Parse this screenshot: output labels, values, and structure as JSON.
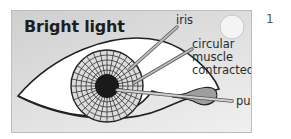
{
  "diagram": {
    "title": "Bright light",
    "labels": {
      "iris": "iris",
      "muscle_line1": "circular",
      "muscle_line2": "muscle",
      "muscle_line3": "contracted",
      "pupil": "pupil"
    },
    "icons": {
      "sun": "sun-icon",
      "eye": "eye-icon"
    },
    "colors": {
      "panel_bg_start": "#cfcfcf",
      "panel_bg_end": "#f0f0f0",
      "eye_white": "#ffffff",
      "iris_fill": "#d8d8d8",
      "pupil_fill": "#1a1a1a",
      "pointer_fill": "#a8a8a8",
      "sun_fill": "#f4f4f4"
    }
  },
  "page_number": "1"
}
